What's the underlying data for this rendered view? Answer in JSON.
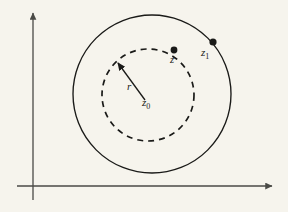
{
  "figure": {
    "background_color": "#f6f4ed",
    "ink_color": "#1a1a18",
    "axis_color": "#4a4a46"
  },
  "axes": {
    "vertical": {
      "name": "imaginary-axis",
      "x": 33,
      "y_top": 13,
      "y_bottom": 200,
      "arrow": "up"
    },
    "horizontal": {
      "name": "real-axis",
      "y": 186,
      "x_left": 17,
      "x_right": 272,
      "arrow": "right"
    }
  },
  "outer_circle": {
    "label": "outer-circle",
    "style": "solid",
    "cx": 152,
    "cy": 94,
    "r": 79
  },
  "inner_circle": {
    "label": "inner-circle",
    "style": "dashed",
    "cx": 148,
    "cy": 95,
    "r": 46,
    "dash_pattern": "6 5"
  },
  "radius_arrow": {
    "label": "radius-arrow",
    "from_x": 145,
    "from_y": 100,
    "to_x": 118,
    "to_y": 63
  },
  "labels": {
    "radius": {
      "text": "r",
      "x": 127,
      "y": 90
    },
    "center": {
      "base": "z",
      "sub": "0",
      "x": 142,
      "y": 106
    },
    "point_z": {
      "base": "z",
      "sub": "",
      "x": 170,
      "y": 63
    },
    "point_z1": {
      "base": "z",
      "sub": "1",
      "x": 201,
      "y": 56
    }
  },
  "points": [
    {
      "name": "point-z",
      "cx": 174,
      "cy": 50,
      "r": 3.4
    },
    {
      "name": "point-z1",
      "cx": 213,
      "cy": 42,
      "r": 3.6
    }
  ]
}
